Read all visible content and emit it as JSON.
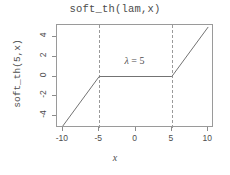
{
  "chart_data": {
    "type": "line",
    "title": "soft_th(lam,x)",
    "xlabel": "x",
    "ylabel": "soft_th(5,x)",
    "xlim": [
      -10.8,
      10.8
    ],
    "ylim": [
      -5.2,
      5.2
    ],
    "grid": false,
    "legend": null,
    "series": [
      {
        "name": "soft_th(5,x)",
        "color": "#737373",
        "linestyle": "solid",
        "x": [
          -10,
          -5,
          5,
          10
        ],
        "values": [
          -5,
          0,
          0,
          5
        ]
      }
    ],
    "reference_lines": [
      {
        "name": "lambda-negative",
        "orientation": "vertical",
        "value": -5,
        "linestyle": "dashed",
        "color": "#9a9a9a"
      },
      {
        "name": "lambda-positive",
        "orientation": "vertical",
        "value": 5,
        "linestyle": "dashed",
        "color": "#9a9a9a"
      }
    ],
    "annotations": [
      {
        "name": "lambda-label",
        "symbol": "λ",
        "equals": " = ",
        "value": "5",
        "text": "λ = 5",
        "x": 0,
        "y": 1.4
      }
    ],
    "xticks": [
      {
        "value": -10,
        "label": "-10"
      },
      {
        "value": -5,
        "label": "-5"
      },
      {
        "value": 0,
        "label": "0"
      },
      {
        "value": 5,
        "label": "5"
      },
      {
        "value": 10,
        "label": "10"
      }
    ],
    "yticks": [
      {
        "value": 4,
        "label": "4"
      },
      {
        "value": 2,
        "label": "2"
      },
      {
        "value": 0,
        "label": "0"
      },
      {
        "value": -2,
        "label": "-2"
      },
      {
        "value": -4,
        "label": "-4"
      }
    ]
  }
}
